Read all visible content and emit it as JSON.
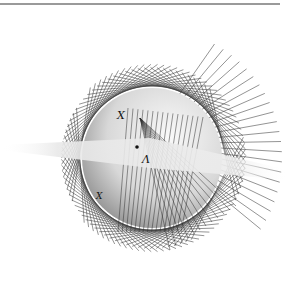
{
  "figure": {
    "top_rule_color": "#9a9a9a",
    "sphere": {
      "cx": 152,
      "cy": 158,
      "r": 70,
      "fill_light": "#f2f2f2",
      "fill_dark": "#8a8a8a"
    },
    "plane": {
      "color": "#e6e6e6"
    },
    "line_color": "#333333",
    "labels": [
      {
        "id": "x-upper",
        "text": "X",
        "x": 118,
        "y": 118
      },
      {
        "id": "lambda",
        "text": "Λ",
        "x": 142,
        "y": 162
      },
      {
        "id": "x-lower",
        "text": "X",
        "x": 97,
        "y": 198
      }
    ],
    "point": {
      "x": 137,
      "y": 147
    }
  }
}
